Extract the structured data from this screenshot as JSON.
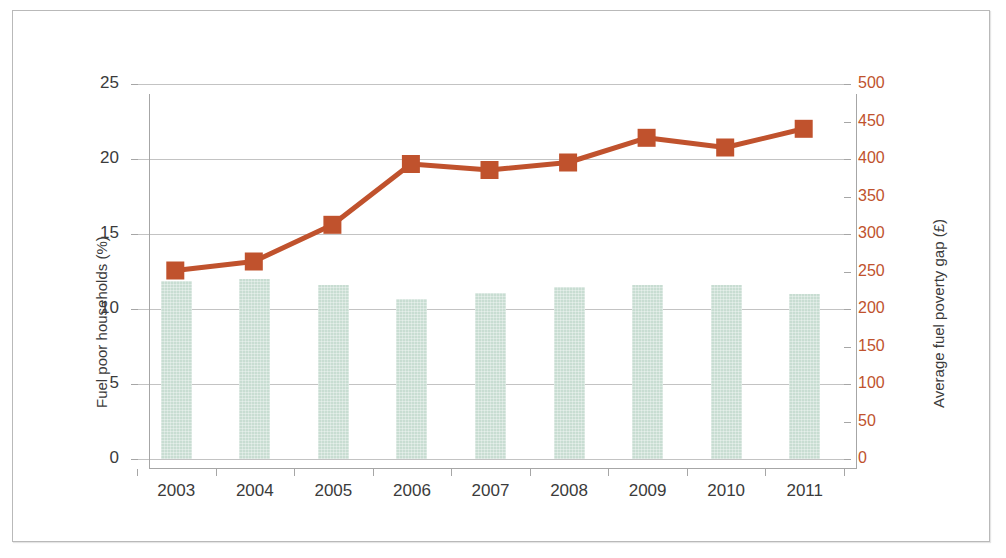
{
  "chart_data": {
    "type": "bar",
    "title": "",
    "subtitle": "",
    "xlabel": "",
    "categories": [
      "2003",
      "2004",
      "2005",
      "2006",
      "2007",
      "2008",
      "2009",
      "2010",
      "2011"
    ],
    "grid": true,
    "legend_position": "none",
    "axes": {
      "left": {
        "label": "Fuel poor households (%)",
        "ticks": [
          "0",
          "5",
          "10",
          "15",
          "20",
          "25"
        ],
        "tick_values": [
          0,
          5,
          10,
          15,
          20,
          25
        ],
        "ylim": [
          0,
          25
        ],
        "color": "#3b3b3b"
      },
      "right": {
        "label": "Average fuel poverty gap (£)",
        "ticks": [
          "0",
          "50",
          "100",
          "150",
          "200",
          "250",
          "300",
          "350",
          "400",
          "450",
          "500"
        ],
        "tick_values": [
          0,
          50,
          100,
          150,
          200,
          250,
          300,
          350,
          400,
          450,
          500
        ],
        "ylim": [
          0,
          500
        ],
        "tick_label_color": "#c0522d",
        "label_color": "#3b3b3b"
      }
    },
    "series": [
      {
        "name": "Fuel poor households (%)",
        "type": "bar",
        "axis": "left",
        "color": "#c8ddd2",
        "values": [
          11.9,
          12.0,
          11.6,
          10.7,
          11.1,
          11.5,
          11.6,
          11.6,
          11.0
        ]
      },
      {
        "name": "Average fuel poverty gap (£)",
        "type": "line",
        "axis": "right",
        "color": "#c0522d",
        "marker": "square",
        "values": [
          250,
          262,
          311,
          392,
          384,
          394,
          427,
          414,
          439
        ]
      }
    ]
  },
  "colors": {
    "bar_fill": "#c8ddd2",
    "line": "#c0522d",
    "gridline": "#c3c3c3",
    "axis": "#a6a6a6",
    "text": "#3b3b3b",
    "frame": "#b9b9b9",
    "background": "#ffffff"
  }
}
